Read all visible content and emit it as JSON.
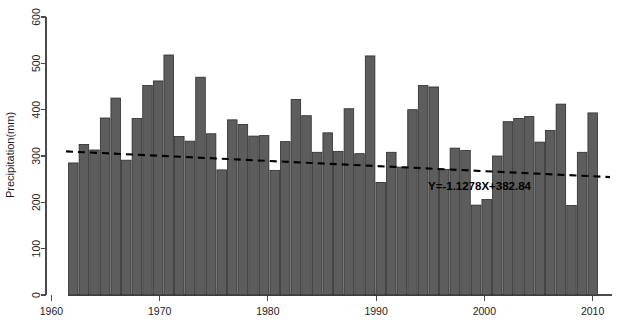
{
  "chart_data": {
    "type": "bar",
    "title": "",
    "subtitle": "",
    "xlabel": "",
    "ylabel": "Precipitation(mm)",
    "xlim": [
      1959.5,
      2010.5
    ],
    "ylim": [
      0,
      600
    ],
    "ytick_values": [
      0,
      100,
      200,
      300,
      400,
      500,
      600
    ],
    "ytick_labels": [
      "0",
      "100",
      "200",
      "300",
      "400",
      "500",
      "600"
    ],
    "xtick_values": [
      1960,
      1970,
      1980,
      1990,
      2000,
      2010
    ],
    "xtick_labels": [
      "1960",
      "1970",
      "1980",
      "1990",
      "2000",
      "2010"
    ],
    "grid": false,
    "legend": null,
    "bar_color": "#5d5d5d",
    "bar_edge_color": "#2b2b2b",
    "trendline_color": "#000000",
    "categories": [
      1960,
      1961,
      1962,
      1963,
      1964,
      1965,
      1966,
      1967,
      1968,
      1969,
      1970,
      1971,
      1972,
      1973,
      1974,
      1975,
      1976,
      1977,
      1978,
      1979,
      1980,
      1981,
      1982,
      1983,
      1984,
      1985,
      1986,
      1987,
      1988,
      1989,
      1990,
      1991,
      1992,
      1993,
      1994,
      1995,
      1996,
      1997,
      1998,
      1999,
      2000,
      2001,
      2002,
      2003,
      2004,
      2005,
      2006,
      2007,
      2008,
      2009
    ],
    "values": [
      285,
      325,
      313,
      382,
      425,
      291,
      381,
      452,
      462,
      518,
      342,
      332,
      470,
      348,
      270,
      378,
      368,
      343,
      344,
      269,
      331,
      422,
      387,
      308,
      350,
      310,
      402,
      305,
      516,
      243,
      308,
      276,
      400,
      452,
      449,
      271,
      317,
      312,
      194,
      206,
      300,
      374,
      381,
      385,
      330,
      355,
      412,
      193,
      308,
      393
    ],
    "series_name": "Annual precipitation",
    "annotations": [
      {
        "name": "trend-equation",
        "text": "Y=-1.1278X+382.84",
        "x_frac": 0.766,
        "y_frac": 0.576
      }
    ],
    "trendline": {
      "slope_per_year": -1.1278,
      "intercept_display": 382.84,
      "y_start": 310.0,
      "y_end": 254.5,
      "equation": "Y=-1.1278X+382.84"
    }
  }
}
